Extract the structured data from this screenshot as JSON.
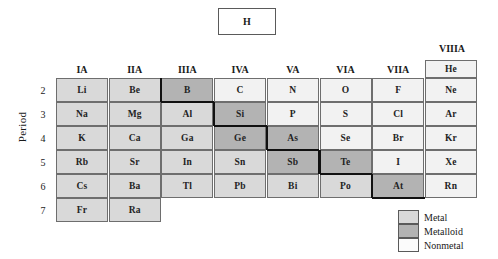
{
  "hydrogen": {
    "symbol": "H"
  },
  "axis": {
    "period_label": "Period"
  },
  "groups": [
    "IA",
    "IIA",
    "IIIA",
    "IVA",
    "VA",
    "VIA",
    "VIIA"
  ],
  "group_viiia": "VIIIA",
  "periods": [
    "2",
    "3",
    "4",
    "5",
    "6",
    "7"
  ],
  "legend": [
    {
      "key": "metal",
      "label": "Metal",
      "color": "#d9d9d9"
    },
    {
      "key": "metalloid",
      "label": "Metalloid",
      "color": "#b3b3b3"
    },
    {
      "key": "nonmetal",
      "label": "Nonmetal",
      "color": "#fbfbfb"
    }
  ],
  "colors": {
    "metal": "#d9d9d9",
    "metalloid": "#b3b3b3",
    "nonmetal": "#f2f2f2",
    "grid_line": "#6e6e6e",
    "stair_line": "#111111"
  },
  "chart_data": {
    "type": "table",
    "xlabel": "Group",
    "ylabel": "Period",
    "categories": [
      "IA",
      "IIA",
      "IIIA",
      "IVA",
      "VA",
      "VIA",
      "VIIA",
      "VIIIA"
    ],
    "rows": [
      "2",
      "3",
      "4",
      "5",
      "6",
      "7"
    ],
    "cells": [
      {
        "symbol": "He",
        "group": 8,
        "period": 1,
        "class": "nonmetal"
      },
      {
        "symbol": "Li",
        "group": 1,
        "period": 2,
        "class": "metal"
      },
      {
        "symbol": "Be",
        "group": 2,
        "period": 2,
        "class": "metal"
      },
      {
        "symbol": "B",
        "group": 3,
        "period": 2,
        "class": "metalloid"
      },
      {
        "symbol": "C",
        "group": 4,
        "period": 2,
        "class": "nonmetal"
      },
      {
        "symbol": "N",
        "group": 5,
        "period": 2,
        "class": "nonmetal"
      },
      {
        "symbol": "O",
        "group": 6,
        "period": 2,
        "class": "nonmetal"
      },
      {
        "symbol": "F",
        "group": 7,
        "period": 2,
        "class": "nonmetal"
      },
      {
        "symbol": "Ne",
        "group": 8,
        "period": 2,
        "class": "nonmetal"
      },
      {
        "symbol": "Na",
        "group": 1,
        "period": 3,
        "class": "metal"
      },
      {
        "symbol": "Mg",
        "group": 2,
        "period": 3,
        "class": "metal"
      },
      {
        "symbol": "Al",
        "group": 3,
        "period": 3,
        "class": "metal"
      },
      {
        "symbol": "Si",
        "group": 4,
        "period": 3,
        "class": "metalloid"
      },
      {
        "symbol": "P",
        "group": 5,
        "period": 3,
        "class": "nonmetal"
      },
      {
        "symbol": "S",
        "group": 6,
        "period": 3,
        "class": "nonmetal"
      },
      {
        "symbol": "Cl",
        "group": 7,
        "period": 3,
        "class": "nonmetal"
      },
      {
        "symbol": "Ar",
        "group": 8,
        "period": 3,
        "class": "nonmetal"
      },
      {
        "symbol": "K",
        "group": 1,
        "period": 4,
        "class": "metal"
      },
      {
        "symbol": "Ca",
        "group": 2,
        "period": 4,
        "class": "metal"
      },
      {
        "symbol": "Ga",
        "group": 3,
        "period": 4,
        "class": "metal"
      },
      {
        "symbol": "Ge",
        "group": 4,
        "period": 4,
        "class": "metalloid"
      },
      {
        "symbol": "As",
        "group": 5,
        "period": 4,
        "class": "metalloid"
      },
      {
        "symbol": "Se",
        "group": 6,
        "period": 4,
        "class": "nonmetal"
      },
      {
        "symbol": "Br",
        "group": 7,
        "period": 4,
        "class": "nonmetal"
      },
      {
        "symbol": "Kr",
        "group": 8,
        "period": 4,
        "class": "nonmetal"
      },
      {
        "symbol": "Rb",
        "group": 1,
        "period": 5,
        "class": "metal"
      },
      {
        "symbol": "Sr",
        "group": 2,
        "period": 5,
        "class": "metal"
      },
      {
        "symbol": "In",
        "group": 3,
        "period": 5,
        "class": "metal"
      },
      {
        "symbol": "Sn",
        "group": 4,
        "period": 5,
        "class": "metal"
      },
      {
        "symbol": "Sb",
        "group": 5,
        "period": 5,
        "class": "metalloid"
      },
      {
        "symbol": "Te",
        "group": 6,
        "period": 5,
        "class": "metalloid"
      },
      {
        "symbol": "I",
        "group": 7,
        "period": 5,
        "class": "nonmetal"
      },
      {
        "symbol": "Xe",
        "group": 8,
        "period": 5,
        "class": "nonmetal"
      },
      {
        "symbol": "Cs",
        "group": 1,
        "period": 6,
        "class": "metal"
      },
      {
        "symbol": "Ba",
        "group": 2,
        "period": 6,
        "class": "metal"
      },
      {
        "symbol": "Tl",
        "group": 3,
        "period": 6,
        "class": "metal"
      },
      {
        "symbol": "Pb",
        "group": 4,
        "period": 6,
        "class": "metal"
      },
      {
        "symbol": "Bi",
        "group": 5,
        "period": 6,
        "class": "metal"
      },
      {
        "symbol": "Po",
        "group": 6,
        "period": 6,
        "class": "metal"
      },
      {
        "symbol": "At",
        "group": 7,
        "period": 6,
        "class": "metalloid"
      },
      {
        "symbol": "Rn",
        "group": 8,
        "period": 6,
        "class": "nonmetal"
      },
      {
        "symbol": "Fr",
        "group": 1,
        "period": 7,
        "class": "metal"
      },
      {
        "symbol": "Ra",
        "group": 2,
        "period": 7,
        "class": "metal"
      }
    ]
  }
}
